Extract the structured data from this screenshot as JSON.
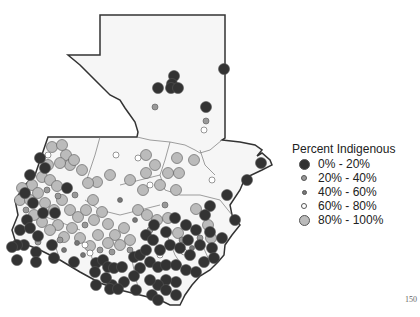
{
  "chart_data": {
    "type": "scatter",
    "title": "",
    "subtitle": "",
    "xlabel": "",
    "ylabel": "",
    "legend": {
      "title": "Percent Indigenous",
      "position": "right",
      "entries": [
        {
          "label": "0% - 20%",
          "fill": "#333333",
          "size": 11
        },
        {
          "label": "20% - 40%",
          "fill": "#999999",
          "size": 6
        },
        {
          "label": "40% - 60%",
          "fill": "#777777",
          "size": 5
        },
        {
          "label": "60% - 80%",
          "fill": "#ffffff",
          "size": 6
        },
        {
          "label": "80% - 100%",
          "fill": "#bbbbbb",
          "size": 11
        }
      ]
    },
    "points": [
      {
        "x": 174,
        "y": 76,
        "cls": 0
      },
      {
        "x": 172,
        "y": 84,
        "cls": 0
      },
      {
        "x": 171,
        "y": 88,
        "cls": 0
      },
      {
        "x": 178,
        "y": 88,
        "cls": 0
      },
      {
        "x": 158,
        "y": 88,
        "cls": 0
      },
      {
        "x": 224,
        "y": 69,
        "cls": 0
      },
      {
        "x": 206,
        "y": 107,
        "cls": 0
      },
      {
        "x": 155,
        "y": 107,
        "cls": 1
      },
      {
        "x": 206,
        "y": 121,
        "cls": 1
      },
      {
        "x": 204,
        "y": 130,
        "cls": 3
      },
      {
        "x": 261,
        "y": 163,
        "cls": 0
      },
      {
        "x": 247,
        "y": 180,
        "cls": 0
      },
      {
        "x": 227,
        "y": 195,
        "cls": 0
      },
      {
        "x": 210,
        "y": 206,
        "cls": 0
      },
      {
        "x": 196,
        "y": 209,
        "cls": 4
      },
      {
        "x": 179,
        "y": 173,
        "cls": 4
      },
      {
        "x": 176,
        "y": 190,
        "cls": 4
      },
      {
        "x": 168,
        "y": 173,
        "cls": 4
      },
      {
        "x": 194,
        "y": 160,
        "cls": 4
      },
      {
        "x": 177,
        "y": 158,
        "cls": 4
      },
      {
        "x": 146,
        "y": 155,
        "cls": 4
      },
      {
        "x": 155,
        "y": 165,
        "cls": 4
      },
      {
        "x": 146,
        "y": 173,
        "cls": 4
      },
      {
        "x": 160,
        "y": 185,
        "cls": 4
      },
      {
        "x": 143,
        "y": 190,
        "cls": 4
      },
      {
        "x": 130,
        "y": 180,
        "cls": 4
      },
      {
        "x": 110,
        "y": 175,
        "cls": 4
      },
      {
        "x": 97,
        "y": 182,
        "cls": 4
      },
      {
        "x": 88,
        "y": 183,
        "cls": 4
      },
      {
        "x": 93,
        "y": 200,
        "cls": 4
      },
      {
        "x": 66,
        "y": 155,
        "cls": 4
      },
      {
        "x": 70,
        "y": 165,
        "cls": 4
      },
      {
        "x": 60,
        "y": 163,
        "cls": 4
      },
      {
        "x": 48,
        "y": 165,
        "cls": 4
      },
      {
        "x": 42,
        "y": 177,
        "cls": 4
      },
      {
        "x": 50,
        "y": 180,
        "cls": 4
      },
      {
        "x": 57,
        "y": 186,
        "cls": 4
      },
      {
        "x": 32,
        "y": 185,
        "cls": 4
      },
      {
        "x": 22,
        "y": 188,
        "cls": 4
      },
      {
        "x": 20,
        "y": 200,
        "cls": 4
      },
      {
        "x": 30,
        "y": 200,
        "cls": 4
      },
      {
        "x": 38,
        "y": 193,
        "cls": 4
      },
      {
        "x": 45,
        "y": 203,
        "cls": 4
      },
      {
        "x": 54,
        "y": 210,
        "cls": 4
      },
      {
        "x": 62,
        "y": 200,
        "cls": 4
      },
      {
        "x": 70,
        "y": 210,
        "cls": 4
      },
      {
        "x": 78,
        "y": 217,
        "cls": 4
      },
      {
        "x": 86,
        "y": 210,
        "cls": 4
      },
      {
        "x": 94,
        "y": 220,
        "cls": 4
      },
      {
        "x": 102,
        "y": 212,
        "cls": 4
      },
      {
        "x": 108,
        "y": 224,
        "cls": 4
      },
      {
        "x": 115,
        "y": 235,
        "cls": 4
      },
      {
        "x": 124,
        "y": 228,
        "cls": 4
      },
      {
        "x": 130,
        "y": 240,
        "cls": 4
      },
      {
        "x": 120,
        "y": 245,
        "cls": 4
      },
      {
        "x": 108,
        "y": 243,
        "cls": 4
      },
      {
        "x": 98,
        "y": 235,
        "cls": 4
      },
      {
        "x": 90,
        "y": 246,
        "cls": 4
      },
      {
        "x": 80,
        "y": 238,
        "cls": 4
      },
      {
        "x": 72,
        "y": 228,
        "cls": 4
      },
      {
        "x": 64,
        "y": 237,
        "cls": 4
      },
      {
        "x": 58,
        "y": 225,
        "cls": 4
      },
      {
        "x": 50,
        "y": 230,
        "cls": 4
      },
      {
        "x": 42,
        "y": 222,
        "cls": 4
      },
      {
        "x": 34,
        "y": 215,
        "cls": 4
      },
      {
        "x": 138,
        "y": 210,
        "cls": 4
      },
      {
        "x": 147,
        "y": 215,
        "cls": 4
      },
      {
        "x": 157,
        "y": 220,
        "cls": 4
      },
      {
        "x": 168,
        "y": 218,
        "cls": 4
      },
      {
        "x": 208,
        "y": 225,
        "cls": 4
      },
      {
        "x": 211,
        "y": 238,
        "cls": 4
      },
      {
        "x": 178,
        "y": 233,
        "cls": 4
      },
      {
        "x": 52,
        "y": 147,
        "cls": 4
      },
      {
        "x": 62,
        "y": 145,
        "cls": 4
      },
      {
        "x": 74,
        "y": 160,
        "cls": 4
      },
      {
        "x": 82,
        "y": 170,
        "cls": 4
      },
      {
        "x": 45,
        "y": 168,
        "cls": 0
      },
      {
        "x": 30,
        "y": 175,
        "cls": 0
      },
      {
        "x": 25,
        "y": 193,
        "cls": 0
      },
      {
        "x": 40,
        "y": 158,
        "cls": 0
      },
      {
        "x": 67,
        "y": 188,
        "cls": 0
      },
      {
        "x": 33,
        "y": 203,
        "cls": 0
      },
      {
        "x": 43,
        "y": 213,
        "cls": 0
      },
      {
        "x": 55,
        "y": 213,
        "cls": 0
      },
      {
        "x": 27,
        "y": 220,
        "cls": 0
      },
      {
        "x": 20,
        "y": 230,
        "cls": 0
      },
      {
        "x": 30,
        "y": 228,
        "cls": 0
      },
      {
        "x": 38,
        "y": 236,
        "cls": 0
      },
      {
        "x": 24,
        "y": 245,
        "cls": 0
      },
      {
        "x": 17,
        "y": 245,
        "cls": 0
      },
      {
        "x": 36,
        "y": 252,
        "cls": 0
      },
      {
        "x": 52,
        "y": 245,
        "cls": 0
      },
      {
        "x": 54,
        "y": 258,
        "cls": 0
      },
      {
        "x": 74,
        "y": 262,
        "cls": 0
      },
      {
        "x": 96,
        "y": 263,
        "cls": 0
      },
      {
        "x": 103,
        "y": 260,
        "cls": 0
      },
      {
        "x": 108,
        "y": 267,
        "cls": 0
      },
      {
        "x": 114,
        "y": 268,
        "cls": 0
      },
      {
        "x": 122,
        "y": 267,
        "cls": 0
      },
      {
        "x": 134,
        "y": 257,
        "cls": 0
      },
      {
        "x": 140,
        "y": 255,
        "cls": 0
      },
      {
        "x": 146,
        "y": 235,
        "cls": 0
      },
      {
        "x": 153,
        "y": 240,
        "cls": 0
      },
      {
        "x": 160,
        "y": 250,
        "cls": 0
      },
      {
        "x": 170,
        "y": 245,
        "cls": 0
      },
      {
        "x": 180,
        "y": 248,
        "cls": 0
      },
      {
        "x": 190,
        "y": 255,
        "cls": 0
      },
      {
        "x": 200,
        "y": 245,
        "cls": 0
      },
      {
        "x": 212,
        "y": 248,
        "cls": 0
      },
      {
        "x": 210,
        "y": 232,
        "cls": 0
      },
      {
        "x": 196,
        "y": 230,
        "cls": 0
      },
      {
        "x": 186,
        "y": 225,
        "cls": 0
      },
      {
        "x": 175,
        "y": 218,
        "cls": 0
      },
      {
        "x": 166,
        "y": 232,
        "cls": 0
      },
      {
        "x": 154,
        "y": 225,
        "cls": 0
      },
      {
        "x": 146,
        "y": 250,
        "cls": 0
      },
      {
        "x": 150,
        "y": 262,
        "cls": 0
      },
      {
        "x": 158,
        "y": 267,
        "cls": 0
      },
      {
        "x": 166,
        "y": 265,
        "cls": 0
      },
      {
        "x": 176,
        "y": 265,
        "cls": 0
      },
      {
        "x": 186,
        "y": 270,
        "cls": 0
      },
      {
        "x": 176,
        "y": 282,
        "cls": 0
      },
      {
        "x": 166,
        "y": 280,
        "cls": 0
      },
      {
        "x": 158,
        "y": 285,
        "cls": 0
      },
      {
        "x": 150,
        "y": 280,
        "cls": 0
      },
      {
        "x": 140,
        "y": 268,
        "cls": 0
      },
      {
        "x": 134,
        "y": 276,
        "cls": 0
      },
      {
        "x": 124,
        "y": 282,
        "cls": 0
      },
      {
        "x": 112,
        "y": 285,
        "cls": 0
      },
      {
        "x": 106,
        "y": 278,
        "cls": 0
      },
      {
        "x": 96,
        "y": 285,
        "cls": 0
      },
      {
        "x": 110,
        "y": 289,
        "cls": 0
      },
      {
        "x": 118,
        "y": 289,
        "cls": 0
      },
      {
        "x": 95,
        "y": 272,
        "cls": 0
      },
      {
        "x": 176,
        "y": 295,
        "cls": 0
      },
      {
        "x": 166,
        "y": 290,
        "cls": 0
      },
      {
        "x": 152,
        "y": 295,
        "cls": 0
      },
      {
        "x": 158,
        "y": 300,
        "cls": 0
      },
      {
        "x": 136,
        "y": 290,
        "cls": 0
      },
      {
        "x": 196,
        "y": 272,
        "cls": 0
      },
      {
        "x": 204,
        "y": 262,
        "cls": 0
      },
      {
        "x": 214,
        "y": 258,
        "cls": 0
      },
      {
        "x": 222,
        "y": 238,
        "cls": 0
      },
      {
        "x": 235,
        "y": 220,
        "cls": 0
      },
      {
        "x": 205,
        "y": 215,
        "cls": 0
      },
      {
        "x": 188,
        "y": 240,
        "cls": 0
      },
      {
        "x": 12,
        "y": 247,
        "cls": 0
      },
      {
        "x": 36,
        "y": 262,
        "cls": 0
      },
      {
        "x": 17,
        "y": 260,
        "cls": 0
      },
      {
        "x": 47,
        "y": 190,
        "cls": 1
      },
      {
        "x": 58,
        "y": 196,
        "cls": 1
      },
      {
        "x": 75,
        "y": 195,
        "cls": 1
      },
      {
        "x": 85,
        "y": 225,
        "cls": 1
      },
      {
        "x": 100,
        "y": 250,
        "cls": 1
      },
      {
        "x": 112,
        "y": 252,
        "cls": 1
      },
      {
        "x": 130,
        "y": 250,
        "cls": 1
      },
      {
        "x": 165,
        "y": 205,
        "cls": 1
      },
      {
        "x": 182,
        "y": 240,
        "cls": 1
      },
      {
        "x": 60,
        "y": 240,
        "cls": 1
      },
      {
        "x": 38,
        "y": 242,
        "cls": 1
      },
      {
        "x": 26,
        "y": 210,
        "cls": 1
      },
      {
        "x": 150,
        "y": 230,
        "cls": 1
      },
      {
        "x": 200,
        "y": 238,
        "cls": 1
      },
      {
        "x": 77,
        "y": 243,
        "cls": 2
      },
      {
        "x": 83,
        "y": 255,
        "cls": 2
      },
      {
        "x": 64,
        "y": 250,
        "cls": 2
      },
      {
        "x": 120,
        "y": 200,
        "cls": 2
      },
      {
        "x": 135,
        "y": 220,
        "cls": 2
      },
      {
        "x": 192,
        "y": 248,
        "cls": 2
      },
      {
        "x": 212,
        "y": 180,
        "cls": 3
      },
      {
        "x": 116,
        "y": 155,
        "cls": 3
      },
      {
        "x": 150,
        "y": 185,
        "cls": 3
      },
      {
        "x": 24,
        "y": 195,
        "cls": 3
      },
      {
        "x": 160,
        "y": 255,
        "cls": 3
      },
      {
        "x": 85,
        "y": 245,
        "cls": 3
      },
      {
        "x": 90,
        "y": 253,
        "cls": 3
      },
      {
        "x": 184,
        "y": 252,
        "cls": 3
      },
      {
        "x": 138,
        "y": 158,
        "cls": 3
      },
      {
        "x": 48,
        "y": 155,
        "cls": 3
      }
    ]
  },
  "legend": {
    "title": "Percent Indigenous",
    "items": [
      {
        "label": "0% - 20%"
      },
      {
        "label": "20% - 40%"
      },
      {
        "label": "40% - 60%"
      },
      {
        "label": "60% - 80%"
      },
      {
        "label": "80% - 100%"
      }
    ]
  },
  "page_number": "150"
}
